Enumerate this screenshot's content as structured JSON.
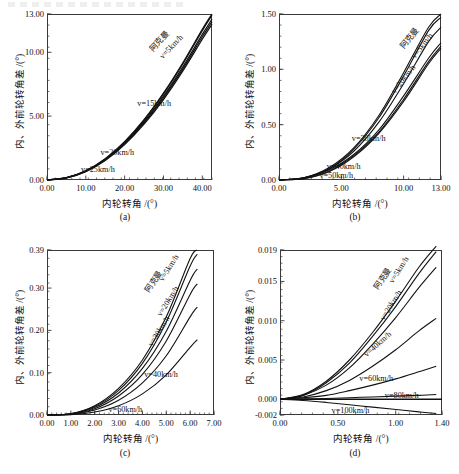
{
  "figure": {
    "artifact_top_strip": "",
    "panels": [
      {
        "id": "a",
        "caption": "(a)",
        "xlabel": "内轮转角 /(°)",
        "ylabel": "内、外前轮转角差 /(°)",
        "xticks": [
          "0.00",
          "10.00",
          "20.00",
          "30.00",
          "40.00"
        ],
        "xtickvals": [
          0,
          10,
          20,
          30,
          40
        ],
        "yticks": [
          "0.00",
          "5.00",
          "10.00",
          "13.00"
        ],
        "ytickvals": [
          0,
          5,
          10,
          13
        ],
        "xlim": [
          0,
          42.5
        ],
        "ylim": [
          0,
          13
        ],
        "labels": [
          {
            "text": "阿克曼",
            "rot": -46
          },
          {
            "text": "v=5km/h",
            "rot": -46
          },
          {
            "text": "v=15km/h",
            "rot": 0
          },
          {
            "text": "v=20km/h",
            "rot": 0
          },
          {
            "text": "v=25km/h",
            "rot": 0
          }
        ]
      },
      {
        "id": "b",
        "caption": "(b)",
        "xlabel": "内轮转角 /(°)",
        "ylabel": "内、外前轮转角差 /(°)",
        "xticks": [
          "0.00",
          "5.00",
          "10.00",
          "13.00"
        ],
        "xtickvals": [
          0,
          5,
          10,
          13
        ],
        "yticks": [
          "0.00",
          "0.50",
          "1.00",
          "1.50"
        ],
        "ytickvals": [
          0,
          0.5,
          1.0,
          1.5
        ],
        "xlim": [
          0,
          13
        ],
        "ylim": [
          0,
          1.5
        ],
        "labels": [
          {
            "text": "阿克曼",
            "rot": -52
          },
          {
            "text": "v=5km/h",
            "rot": -52
          },
          {
            "text": "v=20km/h",
            "rot": -52
          },
          {
            "text": "v=30km/h",
            "rot": 0
          },
          {
            "text": "v=40km/h",
            "rot": 0
          },
          {
            "text": "v=50km/h",
            "rot": 0
          }
        ]
      },
      {
        "id": "c",
        "caption": "(c)",
        "xlabel": "内轮转角 /(°)",
        "ylabel": "内、外前轮转角差 /(°)",
        "xticks": [
          "0.00",
          "1.00",
          "2.00",
          "3.00",
          "4.00",
          "5.00",
          "6.00",
          "7.00"
        ],
        "xtickvals": [
          0,
          1,
          2,
          3,
          4,
          5,
          6,
          7
        ],
        "yticks": [
          "0.00",
          "0.10",
          "0.20",
          "0.30",
          "0.39"
        ],
        "ytickvals": [
          0,
          0.1,
          0.2,
          0.3,
          0.39
        ],
        "xlim": [
          0,
          7
        ],
        "ylim": [
          0,
          0.39
        ],
        "labels": [
          {
            "text": "阿克曼",
            "rot": -58
          },
          {
            "text": "v=5km/h",
            "rot": -58
          },
          {
            "text": "v=20km/h",
            "rot": -58
          },
          {
            "text": "v=30km/h",
            "rot": -58
          },
          {
            "text": "v=40km/h",
            "rot": 0
          },
          {
            "text": "v=60km/h",
            "rot": 0
          }
        ]
      },
      {
        "id": "d",
        "caption": "(d)",
        "xlabel": "内轮转角 /(°)",
        "ylabel": "内、外前轮转角差 /(°)",
        "xticks": [
          "0.00",
          "0.50",
          "1.00",
          "1.40"
        ],
        "xtickvals": [
          0,
          0.5,
          1.0,
          1.4
        ],
        "yticks": [
          "-0.002",
          "0.000",
          "0.005",
          "0.010",
          "0.015",
          "0.019"
        ],
        "ytickvals": [
          -0.002,
          0,
          0.005,
          0.01,
          0.015,
          0.019
        ],
        "xlim": [
          0,
          1.4
        ],
        "ylim": [
          -0.002,
          0.019
        ],
        "labels": [
          {
            "text": "阿克曼",
            "rot": -58
          },
          {
            "text": "v=5km/h",
            "rot": -58
          },
          {
            "text": "v=20km/h",
            "rot": -58
          },
          {
            "text": "v=40km/h",
            "rot": -42
          },
          {
            "text": "v=60km/h",
            "rot": 0
          },
          {
            "text": "v=80km/h",
            "rot": 0
          },
          {
            "text": "v=100km/h",
            "rot": 0
          }
        ]
      }
    ]
  },
  "chart_data": [
    {
      "type": "line",
      "panel": "(a)",
      "title": "",
      "xlabel": "内轮转角 /(°)",
      "ylabel": "内、外前轮转角差 /(°)",
      "xlim": [
        0,
        42.5
      ],
      "ylim": [
        0,
        13
      ],
      "xticks": [
        0,
        10,
        20,
        30,
        40
      ],
      "yticks": [
        0,
        5,
        10,
        13
      ],
      "grid": false,
      "legend": "inline-curve-labels",
      "series": [
        {
          "name": "阿克曼",
          "x": [
            0,
            5,
            10,
            15,
            20,
            25,
            30,
            35,
            40,
            42.5
          ],
          "y": [
            0,
            0.18,
            0.72,
            1.66,
            3.0,
            4.72,
            6.8,
            9.18,
            11.8,
            13.0
          ]
        },
        {
          "name": "v=5km/h",
          "x": [
            0,
            5,
            10,
            15,
            20,
            25,
            30,
            35,
            40,
            42.5
          ],
          "y": [
            0,
            0.18,
            0.72,
            1.65,
            2.98,
            4.68,
            6.74,
            9.1,
            11.7,
            12.9
          ]
        },
        {
          "name": "v=15km/h",
          "x": [
            0,
            5,
            10,
            15,
            20,
            25,
            30,
            35,
            40,
            42.5
          ],
          "y": [
            0,
            0.17,
            0.7,
            1.61,
            2.9,
            4.56,
            6.56,
            8.86,
            11.4,
            12.6
          ]
        },
        {
          "name": "v=20km/h",
          "x": [
            0,
            5,
            10,
            15,
            20,
            25,
            30,
            35,
            40,
            42.5
          ],
          "y": [
            0,
            0.17,
            0.68,
            1.57,
            2.84,
            4.47,
            6.44,
            8.7,
            11.22,
            12.4
          ]
        },
        {
          "name": "v=25km/h",
          "x": [
            0,
            5,
            10,
            15,
            20,
            25,
            30,
            35,
            40,
            42.5
          ],
          "y": [
            0,
            0.16,
            0.66,
            1.53,
            2.77,
            4.37,
            6.3,
            8.54,
            11.02,
            12.2
          ]
        }
      ]
    },
    {
      "type": "line",
      "panel": "(b)",
      "title": "",
      "xlabel": "内轮转角 /(°)",
      "ylabel": "内、外前轮转角差 /(°)",
      "xlim": [
        0,
        13
      ],
      "ylim": [
        0,
        1.5
      ],
      "xticks": [
        0,
        5,
        10,
        13
      ],
      "yticks": [
        0,
        0.5,
        1.0,
        1.5
      ],
      "grid": false,
      "legend": "inline-curve-labels",
      "series": [
        {
          "name": "阿克曼",
          "x": [
            0,
            2,
            4,
            6,
            8,
            10,
            12,
            13
          ],
          "y": [
            0,
            0.02,
            0.11,
            0.29,
            0.58,
            0.97,
            1.38,
            1.5
          ]
        },
        {
          "name": "v=5km/h",
          "x": [
            0,
            2,
            4,
            6,
            8,
            10,
            12,
            13
          ],
          "y": [
            0,
            0.02,
            0.1,
            0.28,
            0.56,
            0.94,
            1.35,
            1.47
          ]
        },
        {
          "name": "v=20km/h",
          "x": [
            0,
            2,
            4,
            6,
            8,
            10,
            12,
            13
          ],
          "y": [
            0,
            0.02,
            0.1,
            0.26,
            0.52,
            0.87,
            1.25,
            1.38
          ]
        },
        {
          "name": "v=30km/h",
          "x": [
            0,
            2,
            4,
            6,
            8,
            10,
            12,
            13
          ],
          "y": [
            0,
            0.02,
            0.09,
            0.23,
            0.45,
            0.76,
            1.1,
            1.24
          ]
        },
        {
          "name": "v=40km/h",
          "x": [
            0,
            2,
            4,
            6,
            8,
            10,
            12,
            13
          ],
          "y": [
            0,
            0.015,
            0.08,
            0.22,
            0.43,
            0.73,
            1.07,
            1.21
          ]
        },
        {
          "name": "v=50km/h",
          "x": [
            0,
            2,
            4,
            6,
            8,
            10,
            12,
            13
          ],
          "y": [
            0,
            0.012,
            0.075,
            0.21,
            0.42,
            0.71,
            1.05,
            1.19
          ]
        }
      ]
    },
    {
      "type": "line",
      "panel": "(c)",
      "title": "",
      "xlabel": "内轮转角 /(°)",
      "ylabel": "内、外前轮转角差 /(°)",
      "xlim": [
        0,
        7
      ],
      "ylim": [
        0,
        0.39
      ],
      "xticks": [
        0,
        1,
        2,
        3,
        4,
        5,
        6,
        7
      ],
      "yticks": [
        0,
        0.1,
        0.2,
        0.3,
        0.39
      ],
      "grid": false,
      "legend": "inline-curve-labels",
      "series": [
        {
          "name": "阿克曼",
          "x": [
            0,
            1,
            2,
            3,
            4,
            5,
            6,
            6.3
          ],
          "y": [
            0,
            0.003,
            0.022,
            0.063,
            0.13,
            0.232,
            0.37,
            0.39
          ]
        },
        {
          "name": "v=5km/h",
          "x": [
            0,
            1,
            2,
            3,
            4,
            5,
            6,
            6.3
          ],
          "y": [
            0,
            0.003,
            0.02,
            0.058,
            0.122,
            0.22,
            0.352,
            0.38
          ]
        },
        {
          "name": "v=20km/h",
          "x": [
            0,
            1,
            2,
            3,
            4,
            5,
            6,
            6.3
          ],
          "y": [
            0,
            0.003,
            0.018,
            0.052,
            0.11,
            0.198,
            0.318,
            0.345
          ]
        },
        {
          "name": "v=30km/h",
          "x": [
            0,
            1,
            2,
            3,
            4,
            5,
            6,
            6.3
          ],
          "y": [
            0,
            0.002,
            0.015,
            0.045,
            0.096,
            0.175,
            0.285,
            0.31
          ]
        },
        {
          "name": "v=40km/h",
          "x": [
            0,
            1,
            2,
            3,
            4,
            5,
            6,
            6.3
          ],
          "y": [
            0,
            0.002,
            0.012,
            0.035,
            0.076,
            0.14,
            0.232,
            0.255
          ]
        },
        {
          "name": "v=60km/h",
          "x": [
            0,
            1,
            2,
            3,
            4,
            5,
            6,
            6.3
          ],
          "y": [
            0,
            0.001,
            0.007,
            0.022,
            0.05,
            0.095,
            0.16,
            0.178
          ]
        }
      ]
    },
    {
      "type": "line",
      "panel": "(d)",
      "title": "",
      "xlabel": "内轮转角 /(°)",
      "ylabel": "内、外前轮转角差 /(°)",
      "xlim": [
        0,
        1.4
      ],
      "ylim": [
        -0.002,
        0.019
      ],
      "xticks": [
        0,
        0.5,
        1.0,
        1.4
      ],
      "yticks": [
        -0.002,
        0.0,
        0.005,
        0.01,
        0.015,
        0.019
      ],
      "grid": false,
      "legend": "inline-curve-labels",
      "series": [
        {
          "name": "阿克曼",
          "x": [
            0,
            0.2,
            0.4,
            0.6,
            0.8,
            1.0,
            1.2,
            1.35
          ],
          "y": [
            0,
            0.0006,
            0.0023,
            0.005,
            0.0085,
            0.0125,
            0.0168,
            0.0195
          ]
        },
        {
          "name": "v=5km/h",
          "x": [
            0,
            0.2,
            0.4,
            0.6,
            0.8,
            1.0,
            1.2,
            1.35
          ],
          "y": [
            0,
            0.0005,
            0.0021,
            0.0046,
            0.008,
            0.0118,
            0.016,
            0.0188
          ]
        },
        {
          "name": "v=20km/h",
          "x": [
            0,
            0.2,
            0.4,
            0.6,
            0.8,
            1.0,
            1.2,
            1.35
          ],
          "y": [
            0,
            0.0005,
            0.0018,
            0.004,
            0.007,
            0.0104,
            0.0142,
            0.0168
          ]
        },
        {
          "name": "v=40km/h",
          "x": [
            0,
            0.2,
            0.4,
            0.6,
            0.8,
            1.0,
            1.2,
            1.35
          ],
          "y": [
            0,
            0.0003,
            0.0011,
            0.0024,
            0.0042,
            0.0063,
            0.0087,
            0.0103
          ]
        },
        {
          "name": "v=60km/h",
          "x": [
            0,
            0.2,
            0.4,
            0.6,
            0.8,
            1.0,
            1.2,
            1.35
          ],
          "y": [
            0,
            0.0002,
            0.0005,
            0.0011,
            0.0018,
            0.0026,
            0.0035,
            0.0042
          ]
        },
        {
          "name": "v=80km/h",
          "x": [
            0,
            0.2,
            0.4,
            0.6,
            0.8,
            1.0,
            1.2,
            1.35
          ],
          "y": [
            0,
            5e-05,
            0.0001,
            0.0002,
            0.0003,
            0.0004,
            0.0005,
            0.0006
          ]
        },
        {
          "name": "v=100km/h",
          "x": [
            0,
            0.2,
            0.4,
            0.6,
            0.8,
            1.0,
            1.2,
            1.35
          ],
          "y": [
            0,
            -0.00015,
            -0.0004,
            -0.0007,
            -0.001,
            -0.0013,
            -0.0016,
            -0.0018
          ]
        }
      ]
    }
  ]
}
